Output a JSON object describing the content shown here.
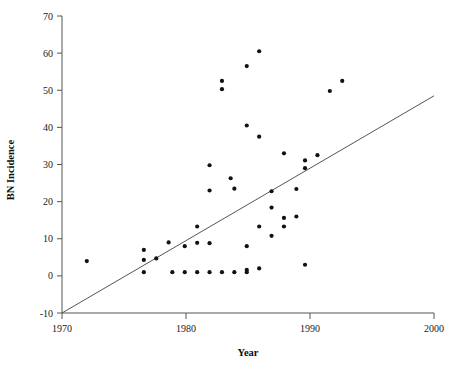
{
  "chart_data": {
    "type": "scatter",
    "title": "",
    "xlabel": "Year",
    "ylabel": "BN Incidence",
    "xlim": [
      1970,
      2000
    ],
    "ylim": [
      -10,
      70
    ],
    "grid": false,
    "legend": null,
    "xticks": [
      1970,
      1980,
      1990,
      2000
    ],
    "xtick_labels": [
      "1970",
      "1980",
      "1990",
      "2000"
    ],
    "yticks": [
      -10,
      0,
      10,
      20,
      30,
      40,
      50,
      60,
      70
    ],
    "ytick_labels": [
      "-10",
      "0",
      "10",
      "20",
      "30",
      "40",
      "50",
      "60",
      "70"
    ],
    "point_color": "#111111",
    "line_color": "#555555",
    "axis_color": "#555555",
    "points": [
      [
        1972.0,
        4.0
      ],
      [
        1976.6,
        7.0
      ],
      [
        1976.6,
        4.3
      ],
      [
        1976.6,
        1.0
      ],
      [
        1977.6,
        4.7
      ],
      [
        1978.6,
        9.0
      ],
      [
        1978.9,
        1.0
      ],
      [
        1979.9,
        8.0
      ],
      [
        1979.9,
        1.0
      ],
      [
        1980.9,
        13.3
      ],
      [
        1980.9,
        8.9
      ],
      [
        1980.9,
        1.0
      ],
      [
        1981.9,
        29.8
      ],
      [
        1981.9,
        23.0
      ],
      [
        1981.9,
        8.8
      ],
      [
        1981.9,
        1.0
      ],
      [
        1982.9,
        52.5
      ],
      [
        1982.9,
        50.3
      ],
      [
        1982.9,
        1.0
      ],
      [
        1983.6,
        26.3
      ],
      [
        1983.9,
        23.5
      ],
      [
        1983.9,
        1.0
      ],
      [
        1984.9,
        56.5
      ],
      [
        1984.9,
        40.5
      ],
      [
        1984.9,
        8.0
      ],
      [
        1984.9,
        1.6
      ],
      [
        1984.9,
        1.0
      ],
      [
        1985.9,
        60.5
      ],
      [
        1985.9,
        37.5
      ],
      [
        1985.9,
        13.3
      ],
      [
        1985.9,
        2.0
      ],
      [
        1986.9,
        22.8
      ],
      [
        1986.9,
        18.4
      ],
      [
        1986.9,
        10.8
      ],
      [
        1987.9,
        33.0
      ],
      [
        1987.9,
        15.6
      ],
      [
        1987.9,
        13.3
      ],
      [
        1988.9,
        23.4
      ],
      [
        1988.9,
        16.0
      ],
      [
        1989.6,
        31.1
      ],
      [
        1989.6,
        29.0
      ],
      [
        1989.6,
        3.0
      ],
      [
        1990.6,
        32.5
      ],
      [
        1991.6,
        49.8
      ],
      [
        1992.6,
        52.5
      ]
    ],
    "trend_line": {
      "x": [
        1970,
        2000
      ],
      "y": [
        -10.0,
        48.5
      ],
      "slope": 1.95,
      "intercept": -10.0
    }
  }
}
